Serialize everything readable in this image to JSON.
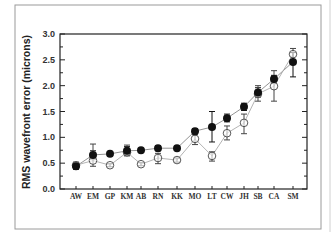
{
  "chart_data": {
    "type": "scatter",
    "title": "",
    "xlabel": "",
    "ylabel": "RMS wavefront error (microns)",
    "ylim": [
      0.0,
      3.0
    ],
    "yticks": [
      "0.0",
      "0.5",
      "1.0",
      "1.5",
      "2.0",
      "2.5",
      "3.0"
    ],
    "grid": false,
    "legend": null,
    "categories": [
      "AW",
      "EM",
      "GP",
      "KM",
      "AB",
      "RN",
      "KK",
      "MO",
      "LT",
      "CW",
      "JH",
      "SB",
      "CA",
      "SM"
    ],
    "series": [
      {
        "name": "filled circles",
        "marker": "filled-circle",
        "values": [
          0.44,
          0.66,
          0.68,
          0.74,
          0.75,
          0.79,
          0.79,
          1.12,
          1.2,
          1.37,
          1.59,
          1.87,
          2.13,
          2.46
        ],
        "err_low": [
          0.38,
          0.58,
          0.64,
          0.66,
          0.72,
          0.74,
          0.76,
          1.07,
          0.91,
          1.3,
          1.52,
          1.78,
          2.05,
          2.17
        ],
        "err_high": [
          0.5,
          0.74,
          0.72,
          0.82,
          0.78,
          0.84,
          0.82,
          1.17,
          1.5,
          1.45,
          1.66,
          1.96,
          2.2,
          2.64
        ]
      },
      {
        "name": "open circles",
        "marker": "open-circle",
        "values": [
          0.46,
          0.55,
          0.46,
          0.71,
          0.48,
          0.6,
          0.56,
          0.97,
          0.64,
          1.08,
          1.28,
          1.84,
          1.99,
          2.61
        ],
        "err_low": [
          0.4,
          0.44,
          0.43,
          0.64,
          0.45,
          0.49,
          0.52,
          0.86,
          0.54,
          0.95,
          1.07,
          1.7,
          1.7,
          2.5
        ],
        "err_high": [
          0.52,
          0.87,
          0.49,
          0.85,
          0.51,
          0.69,
          0.6,
          1.05,
          0.72,
          1.22,
          1.45,
          2.0,
          2.29,
          2.72
        ]
      }
    ],
    "x_positions_px": [
      76,
      93,
      110,
      127,
      141,
      158,
      177,
      195,
      212,
      227,
      244,
      258,
      274,
      293
    ]
  },
  "colors": {
    "filled": "#111111",
    "open_stroke": "#444444",
    "filled_line": "#888888",
    "open_line": "#aaaaaa",
    "axis": "#222222",
    "frame": "#9a9a9a"
  }
}
